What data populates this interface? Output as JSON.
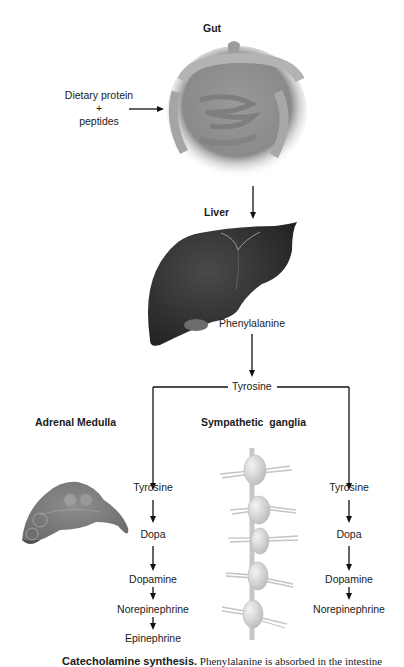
{
  "diagram": {
    "title_gut": "Gut",
    "title_liver": "Liver",
    "title_adrenal": "Adrenal Medulla",
    "title_ganglia": "Sympathetic  ganglia",
    "input": {
      "line1": "Dietary protein",
      "line2": "+",
      "line3": "peptides"
    },
    "liver_product": "Phenylalanine",
    "branch_node": "Tyrosine",
    "adrenal_pathway": [
      "Tyrosine",
      "Dopa",
      "Dopamine",
      "Norepinephrine",
      "Epinephrine"
    ],
    "ganglia_pathway": [
      "Tyrosine",
      "Dopa",
      "Dopamine",
      "Norepinephrine"
    ],
    "images": {
      "gut": "intestine-illustration",
      "liver": "liver-illustration",
      "adrenal": "adrenal-medulla-illustration",
      "ganglia": "sympathetic-ganglia-chain-illustration"
    }
  },
  "caption": {
    "bold": "Catecholamine synthesis.",
    "text": " Phenylalanine is absorbed in the intestine"
  }
}
